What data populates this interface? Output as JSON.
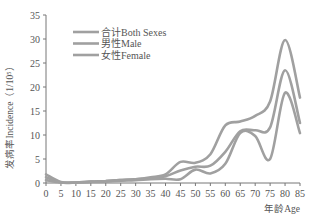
{
  "chart_data": {
    "type": "line",
    "title": "",
    "xlabel": "年龄Age",
    "ylabel": "发病率Incidence（1/10⁵）",
    "x": [
      0,
      5,
      10,
      15,
      20,
      25,
      30,
      35,
      40,
      45,
      50,
      55,
      60,
      65,
      70,
      75,
      80,
      85
    ],
    "xticks": [
      "0",
      "5",
      "10",
      "15",
      "20",
      "25",
      "30",
      "35",
      "40",
      "45",
      "50",
      "55",
      "60",
      "65",
      "70",
      "75",
      "80",
      "85"
    ],
    "yticks": [
      "0",
      "5",
      "10",
      "15",
      "20",
      "25",
      "30",
      "35"
    ],
    "ylim": [
      0,
      35
    ],
    "xlim": [
      0,
      85
    ],
    "grid": false,
    "legend_position": "upper-left",
    "series": [
      {
        "name": "合计Both Sexes",
        "color": "#a0a0a0",
        "values": [
          1.2,
          0.1,
          0.1,
          0.3,
          0.4,
          0.6,
          0.8,
          1.0,
          1.4,
          2.6,
          3.4,
          3.6,
          6.5,
          10.8,
          11.0,
          11.6,
          23.5,
          12.5
        ]
      },
      {
        "name": "男性Male",
        "color": "#a0a0a0",
        "values": [
          1.8,
          0.2,
          0.1,
          0.3,
          0.4,
          0.6,
          0.8,
          1.2,
          1.8,
          4.4,
          4.2,
          6.0,
          12.0,
          12.8,
          14.0,
          17.0,
          29.8,
          17.8
        ]
      },
      {
        "name": "女性Female",
        "color": "#a0a0a0",
        "values": [
          0.6,
          0.1,
          0.1,
          0.2,
          0.3,
          0.5,
          0.6,
          0.8,
          0.9,
          0.8,
          2.8,
          2.0,
          4.0,
          10.4,
          9.8,
          5.0,
          18.8,
          10.4
        ]
      }
    ]
  },
  "legend": {
    "items": [
      {
        "label": "合计Both Sexes"
      },
      {
        "label": "男性Male"
      },
      {
        "label": "女性Female"
      }
    ]
  },
  "axes": {
    "x_title": "年龄Age",
    "y_title": "发病率Incidence（1/10⁵）"
  }
}
